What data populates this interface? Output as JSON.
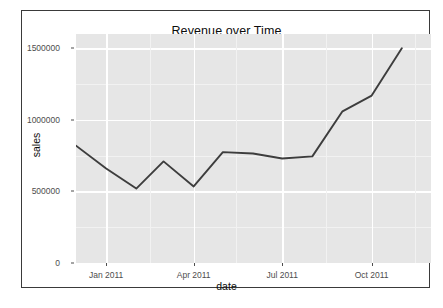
{
  "chart_data": {
    "type": "line",
    "title": "Revenue over Time",
    "xlabel": "date",
    "ylabel": "sales",
    "grid": true,
    "legend": false,
    "theme": "ggplot2-grey",
    "line_color": "#3d3d3d",
    "panel_color": "#e6e6e6",
    "gridline_color": "#ffffff",
    "x_type": "date",
    "xlim": [
      "2010-12-01",
      "2011-12-01"
    ],
    "ylim": [
      0,
      1600000
    ],
    "y_ticks": [
      0,
      500000,
      1000000,
      1500000
    ],
    "y_tick_labels": [
      "0",
      "500000",
      "1000000",
      "1500000"
    ],
    "x_ticks": [
      "2011-01-01",
      "2011-04-01",
      "2011-07-01",
      "2011-10-01"
    ],
    "x_tick_labels": [
      "Jan 2011",
      "Apr 2011",
      "Jul 2011",
      "Oct 2011"
    ],
    "series": [
      {
        "name": "sales",
        "x": [
          "2010-12-01",
          "2011-01-01",
          "2011-02-01",
          "2011-03-01",
          "2011-04-01",
          "2011-05-01",
          "2011-06-01",
          "2011-07-01",
          "2011-08-01",
          "2011-09-01",
          "2011-10-01",
          "2011-11-01"
        ],
        "x_labels": [
          "Dec 2010",
          "Jan 2011",
          "Feb 2011",
          "Mar 2011",
          "Apr 2011",
          "May 2011",
          "Jun 2011",
          "Jul 2011",
          "Aug 2011",
          "Sep 2011",
          "Oct 2011",
          "Nov 2011"
        ],
        "values": [
          820000,
          660000,
          520000,
          710000,
          535000,
          775000,
          765000,
          730000,
          745000,
          1060000,
          1170000,
          1500000
        ]
      }
    ]
  },
  "axis": {
    "y_title": "sales",
    "x_title": "date"
  }
}
